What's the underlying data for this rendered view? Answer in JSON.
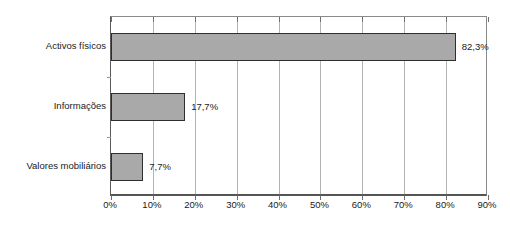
{
  "chart_data": {
    "type": "bar",
    "orientation": "horizontal",
    "title": "",
    "xlabel": "",
    "ylabel": "",
    "categories": [
      "Activos físicos",
      "Informações",
      "Valores mobiliários"
    ],
    "values": [
      82.3,
      17.7,
      7.7
    ],
    "value_labels": [
      "82,3%",
      "17,7%",
      "7,7%"
    ],
    "xlim": [
      0,
      90
    ],
    "xticks": [
      0,
      10,
      20,
      30,
      40,
      50,
      60,
      70,
      80,
      90
    ],
    "xtick_labels": [
      "0%",
      "10%",
      "20%",
      "30%",
      "40%",
      "50%",
      "60%",
      "70%",
      "80%",
      "90%"
    ],
    "grid": "vertical",
    "legend": "none",
    "series": [
      {
        "name": "",
        "values": [
          82.3,
          17.7,
          7.7
        ]
      }
    ],
    "colors": {
      "bar_fill": "#a9a9a9",
      "bar_border": "#2e2e2e",
      "gridline": "#b4b4b4",
      "axis": "#555555",
      "text": "#1a1a1a",
      "background": "#ffffff"
    }
  }
}
